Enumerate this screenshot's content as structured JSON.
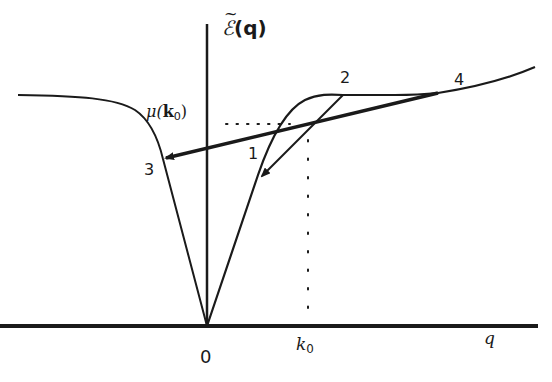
{
  "diagram": {
    "axis_labels": {
      "y_axis": "ℰ̃(q)",
      "y_axis_main": "ℰ",
      "y_axis_arg": "(q)",
      "x_axis": "q",
      "origin": "0",
      "k0_main": "k",
      "k0_sub": "0"
    },
    "mu_label": {
      "prefix": "μ(",
      "var": "k",
      "sub": "0",
      "suffix": ")"
    },
    "points": [
      {
        "id": "1",
        "label": "1"
      },
      {
        "id": "2",
        "label": "2"
      },
      {
        "id": "3",
        "label": "3"
      },
      {
        "id": "4",
        "label": "4"
      }
    ],
    "colors": {
      "ink": "#1a1a1a",
      "background": "#ffffff"
    }
  }
}
